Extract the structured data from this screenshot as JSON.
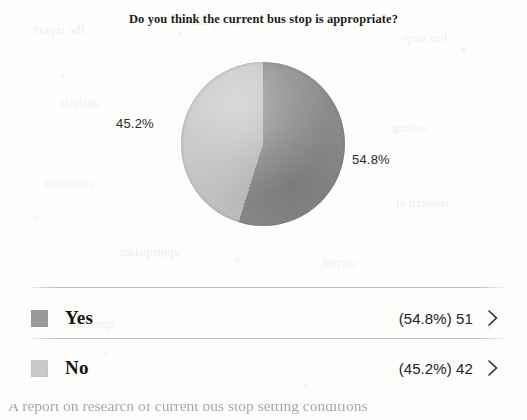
{
  "page": {
    "title": "Do you think the current bus stop is appropriate?",
    "background_color": "#fdfdfc",
    "cutoff_text_bottom": "A report on research of current bus stop setting conditions"
  },
  "chart_data": {
    "type": "pie",
    "title": "Do you think the current bus stop is appropriate?",
    "categories": [
      "Yes",
      "No"
    ],
    "values": [
      51,
      42
    ],
    "percentages": [
      54.8,
      45.2
    ],
    "total": 93,
    "labels": [
      "54.8%",
      "45.2%"
    ],
    "colors": [
      "#8e8e8e",
      "#c6c6c6"
    ],
    "legend_position": "bottom",
    "grid": false,
    "start_angle_deg": 0,
    "slice_label_positions": [
      "right",
      "left"
    ]
  },
  "pie": {
    "slice_yes_label": "54.8%",
    "slice_no_label": "45.2%",
    "color_yes": "#8e8e8e",
    "color_no": "#c6c6c6"
  },
  "legend": {
    "rows": [
      {
        "key": "yes",
        "label": "Yes",
        "value": "(54.8%) 51",
        "percent": "54.8%",
        "count": "51",
        "swatch_color": "#9a9a9a",
        "chevron": "chevron-right-icon"
      },
      {
        "key": "no",
        "label": "No",
        "value": "(45.2%) 42",
        "percent": "45.2%",
        "count": "42",
        "swatch_color": "#c9c9c9",
        "chevron": "chevron-right-icon"
      }
    ]
  },
  "ghosts": [
    {
      "text": "the report",
      "left": 34,
      "top": 22,
      "size": 13
    },
    {
      "text": "survey data",
      "left": 188,
      "top": 14,
      "size": 12
    },
    {
      "text": "bus stop",
      "left": 404,
      "top": 30,
      "size": 13
    },
    {
      "text": "analysis",
      "left": 60,
      "top": 96,
      "size": 12
    },
    {
      "text": "setting",
      "left": 392,
      "top": 120,
      "size": 13
    },
    {
      "text": "conditions",
      "left": 44,
      "top": 176,
      "size": 12
    },
    {
      "text": "research of",
      "left": 396,
      "top": 196,
      "size": 12
    },
    {
      "text": "appropriate",
      "left": 120,
      "top": 244,
      "size": 13
    },
    {
      "text": "current",
      "left": 322,
      "top": 256,
      "size": 12
    },
    {
      "text": "question",
      "left": 70,
      "top": 316,
      "size": 13
    },
    {
      "text": "results",
      "left": 428,
      "top": 356,
      "size": 12
    }
  ]
}
